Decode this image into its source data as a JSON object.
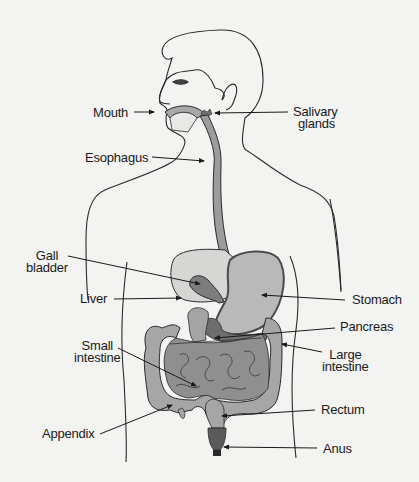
{
  "diagram": {
    "type": "anatomical-diagram",
    "colors": {
      "background": "#f3f3f1",
      "outline": "#2a2a2a",
      "organ_light": "#c9c9c9",
      "organ_mid": "#a8a8a8",
      "organ_dark": "#7d7d7d",
      "liver": "#d9d9d9"
    },
    "labels": {
      "mouth": "Mouth",
      "salivary_1": "Salivary",
      "salivary_2": "glands",
      "esophagus": "Esophagus",
      "gall_1": "Gall",
      "gall_2": "bladder",
      "liver": "Liver",
      "stomach": "Stomach",
      "pancreas": "Pancreas",
      "small_1": "Small",
      "small_2": "intestine",
      "large_1": "Large",
      "large_2": "intestine",
      "rectum": "Rectum",
      "appendix": "Appendix",
      "anus": "Anus"
    }
  }
}
